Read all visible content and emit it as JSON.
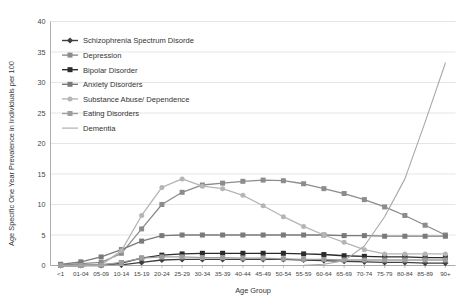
{
  "chart_data": {
    "type": "line",
    "title": "",
    "xlabel": "Age Group",
    "ylabel": "Age Specific One Year Prevalence in Individuals per 100",
    "categories": [
      "<1",
      "01-04",
      "05-09",
      "10-14",
      "15-19",
      "20-24",
      "25-29",
      "30-34",
      "35-39",
      "40-44",
      "45-49",
      "50-54",
      "55-59",
      "60-64",
      "65-69",
      "70-74",
      "75-79",
      "80-84",
      "85-89",
      "90+"
    ],
    "ylim": [
      0,
      40
    ],
    "yticks": [
      0,
      5,
      10,
      15,
      20,
      25,
      30,
      35,
      40
    ],
    "grid": true,
    "legend_position": "upper-left-inside",
    "series": [
      {
        "name": "Schizophrenia Spectrum Disorde",
        "color": "#3f3f3f",
        "marker": "diamond",
        "values": [
          0.0,
          0.0,
          0.0,
          0.1,
          0.5,
          0.9,
          1.0,
          1.0,
          1.0,
          1.0,
          1.0,
          1.0,
          0.9,
          0.8,
          0.7,
          0.6,
          0.5,
          0.5,
          0.4,
          0.4
        ]
      },
      {
        "name": "Depression",
        "color": "#8c8c8c",
        "marker": "square",
        "values": [
          0.1,
          0.3,
          0.5,
          2.0,
          6.0,
          10.0,
          12.0,
          13.2,
          13.5,
          13.8,
          14.0,
          13.9,
          13.4,
          12.6,
          11.8,
          10.8,
          9.6,
          8.2,
          6.6,
          5.0
        ]
      },
      {
        "name": "Bipolar Disorder",
        "color": "#2b2b2b",
        "marker": "square",
        "values": [
          0.0,
          0.0,
          0.1,
          0.4,
          1.2,
          1.7,
          1.9,
          2.0,
          2.0,
          2.0,
          2.0,
          2.0,
          1.9,
          1.8,
          1.6,
          1.5,
          1.4,
          1.4,
          1.3,
          1.3
        ]
      },
      {
        "name": "Anxiety Disorders",
        "color": "#7a7a7a",
        "marker": "square",
        "values": [
          0.2,
          0.6,
          1.4,
          2.6,
          4.0,
          4.9,
          5.0,
          5.0,
          5.0,
          5.0,
          5.0,
          5.0,
          5.0,
          5.0,
          4.9,
          4.9,
          4.8,
          4.8,
          4.8,
          4.8
        ]
      },
      {
        "name": "Substance Abuse/ Dependence",
        "color": "#b5b5b5",
        "marker": "circle",
        "values": [
          0.0,
          0.0,
          0.1,
          2.4,
          8.2,
          12.8,
          14.2,
          13.0,
          12.6,
          11.5,
          9.8,
          8.0,
          6.4,
          5.0,
          3.8,
          2.6,
          1.9,
          1.9,
          1.9,
          1.9
        ]
      },
      {
        "name": "Eating Disorders",
        "color": "#9e9e9e",
        "marker": "square",
        "values": [
          0.0,
          0.0,
          0.1,
          0.5,
          1.2,
          1.4,
          1.4,
          1.3,
          1.3,
          1.2,
          1.2,
          1.1,
          1.0,
          1.0,
          0.9,
          0.9,
          0.9,
          0.9,
          0.9,
          0.9
        ]
      },
      {
        "name": "Dementia",
        "color": "#a8a8a8",
        "marker": "none",
        "values": [
          0.0,
          0.0,
          0.0,
          0.0,
          0.0,
          0.0,
          0.0,
          0.0,
          0.0,
          0.0,
          0.0,
          0.0,
          0.05,
          0.2,
          0.8,
          3.2,
          8.0,
          14.2,
          23.5,
          33.2
        ]
      }
    ]
  },
  "legend": {
    "items": [
      {
        "label": "Schizophrenia Spectrum Disorde",
        "color": "#3f3f3f",
        "marker": "diamond"
      },
      {
        "label": "Depression",
        "color": "#8c8c8c",
        "marker": "square"
      },
      {
        "label": "Bipolar Disorder",
        "color": "#2b2b2b",
        "marker": "square"
      },
      {
        "label": "Anxiety Disorders",
        "color": "#7a7a7a",
        "marker": "square"
      },
      {
        "label": "Substance Abuse/ Dependence",
        "color": "#b5b5b5",
        "marker": "circle"
      },
      {
        "label": "Eating Disorders",
        "color": "#9e9e9e",
        "marker": "square"
      },
      {
        "label": "Dementia",
        "color": "#a8a8a8",
        "marker": "none"
      }
    ]
  }
}
